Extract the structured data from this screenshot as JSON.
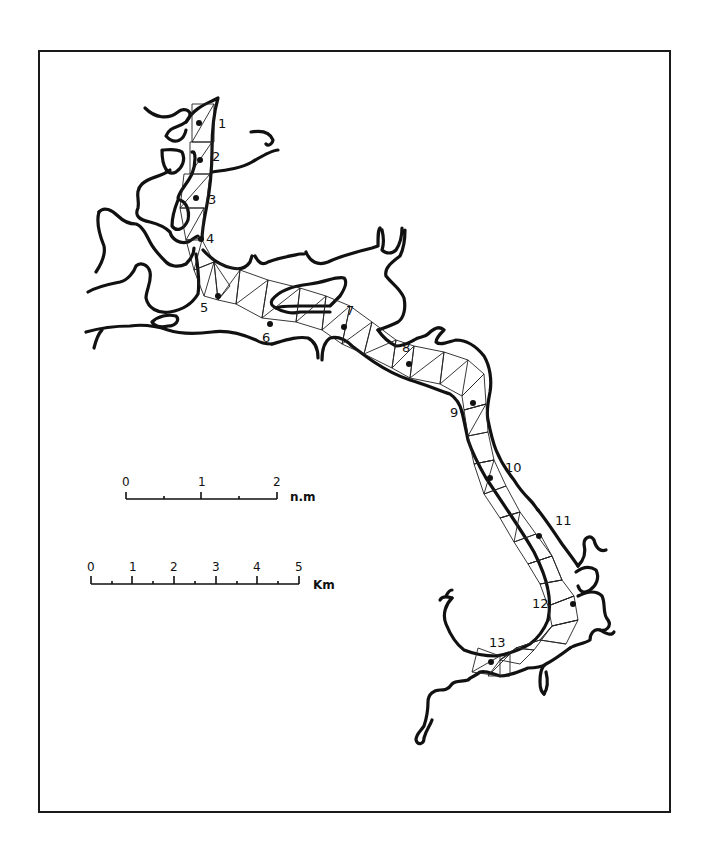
{
  "figure": {
    "type": "estuary map with model grid and sampling stations",
    "frame": {
      "left": 38,
      "top": 50,
      "right": 669,
      "bottom": 811
    }
  },
  "stations": [
    {
      "id": "1",
      "label": "1",
      "dot": [
        199,
        123
      ],
      "label_pos": [
        220,
        128
      ]
    },
    {
      "id": "2",
      "label": "2",
      "dot": [
        200,
        160
      ],
      "label_pos": [
        213,
        160
      ]
    },
    {
      "id": "3",
      "label": "3",
      "dot": [
        196,
        198
      ],
      "label_pos": [
        209,
        202
      ]
    },
    {
      "id": "4",
      "label": "4",
      "dot": [
        201,
        239
      ],
      "label_pos": [
        207,
        242
      ]
    },
    {
      "id": "5",
      "label": "5",
      "dot": [
        218,
        296
      ],
      "label_pos": [
        201,
        312
      ]
    },
    {
      "id": "6",
      "label": "6",
      "dot": [
        270,
        324
      ],
      "label_pos": [
        263,
        341
      ]
    },
    {
      "id": "7",
      "label": "7",
      "dot": [
        344,
        327
      ],
      "label_pos": [
        347,
        314
      ]
    },
    {
      "id": "8",
      "label": "8",
      "dot": [
        409,
        364
      ],
      "label_pos": [
        403,
        351
      ]
    },
    {
      "id": "9",
      "label": "9",
      "dot": [
        473,
        403
      ],
      "label_pos": [
        451,
        416
      ]
    },
    {
      "id": "10",
      "label": "10",
      "dot": [
        490,
        478
      ],
      "label_pos": [
        506,
        471
      ]
    },
    {
      "id": "11",
      "label": "11",
      "dot": [
        539,
        536
      ],
      "label_pos": [
        557,
        524
      ]
    },
    {
      "id": "12",
      "label": "12",
      "dot": [
        573,
        604
      ],
      "label_pos": [
        533,
        607
      ]
    },
    {
      "id": "13",
      "label": "13",
      "dot": [
        491,
        662
      ],
      "label_pos": [
        490,
        646
      ]
    }
  ],
  "scale_bars": [
    {
      "name": "nautical-miles",
      "unit": "n.m",
      "ticks": [
        "0",
        "1",
        "2"
      ],
      "x_start": 126,
      "x_end": 277,
      "y": 499,
      "minor_ticks": 4
    },
    {
      "name": "kilometers",
      "unit": "Km",
      "ticks": [
        "0",
        "1",
        "2",
        "3",
        "4",
        "5"
      ],
      "x_start": 91,
      "x_end": 299,
      "y": 584,
      "minor_ticks": 10
    }
  ],
  "colors": {
    "ink": "#111111",
    "paper": "#ffffff"
  }
}
